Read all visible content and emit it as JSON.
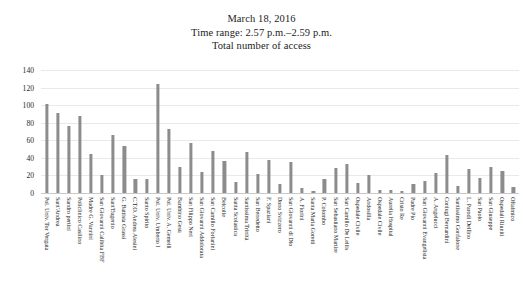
{
  "title": {
    "line1": "March 18, 2016",
    "line2": "Time range: 2.57 p.m.–2.59 p.m.",
    "line3": "Total number of access"
  },
  "axis": {
    "y_ticks": [
      "0",
      "20",
      "40",
      "60",
      "80",
      "100",
      "120",
      "140"
    ]
  },
  "colors": {
    "bar": "#8c8c8c",
    "grid": "#e9e9e9",
    "text": "#1c1c1c",
    "background": "#ffffff"
  },
  "chart_data": {
    "type": "bar",
    "xlabel": "",
    "ylabel": "",
    "ylim": [
      0,
      140
    ],
    "yticks": [
      0,
      20,
      40,
      60,
      80,
      100,
      120,
      140
    ],
    "grid": true,
    "legend": false,
    "categories": [
      "Pol. Univ. Tor Vergata",
      "Sant'Andrea",
      "Sandro pertini",
      "Policlinico Casilino",
      "Madre G. Vannini",
      "San Giovanni Calibita FBF",
      "Sant'Eugenio",
      "G. Battista Grassi",
      "C.T.O. Andrea Alesini",
      "Santo Spirito",
      "Pol. Univ. Umberto I",
      "Pol. Univ. A. Gemelli",
      "Bambino Gesù",
      "San Filippo Neri",
      "San Giovanni Addolorata",
      "San Camillo Forlanini",
      "Belcolle",
      "Santa Scolastica",
      "Santissima Trinità",
      "San Benedetto",
      "F. Spaziani",
      "Dono Svizzero",
      "San Giovanni di Dio",
      "A. Fiorini",
      "Santa Maria Goretti",
      "P. Colombo",
      "San Sebastiano Martire",
      "San Camillo De Lellis",
      "Ospedale Civile",
      "Andosilla",
      "Ospedale Civile",
      "Aurelia Hospital",
      "Cristo Re",
      "Padre Pio",
      "San Giovanni Evangelista",
      "A. Angelucci",
      "Coniugi Bernardini",
      "Santissimo Gonfalone",
      "L. Parodi Delfino",
      "San Paolo",
      "San Giuseppe",
      "Ospedali Riuniti",
      "Oftalmico"
    ],
    "values": [
      101,
      91,
      76,
      88,
      44,
      20,
      66,
      54,
      16,
      16,
      124,
      73,
      30,
      57,
      24,
      48,
      36,
      12,
      47,
      22,
      38,
      10,
      35,
      6,
      2,
      16,
      29,
      33,
      11,
      21,
      4,
      3,
      2,
      10,
      14,
      23,
      43,
      8,
      27,
      17,
      30,
      25,
      7
    ]
  }
}
